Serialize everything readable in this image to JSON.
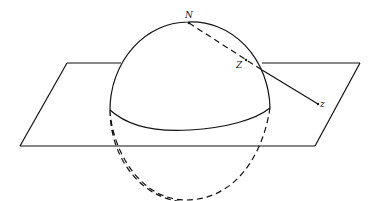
{
  "figure": {
    "labels": {
      "north_pole": "N",
      "sphere_point": "Z",
      "plane_point": "z"
    },
    "colors": {
      "ink": "#111111",
      "background": "#ffffff"
    }
  }
}
